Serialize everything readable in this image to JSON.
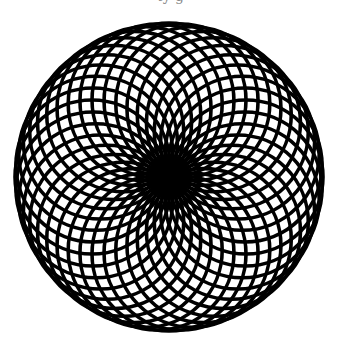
{
  "figure": {
    "caption_partial": "ty g",
    "pattern": "rotated-circles-through-center",
    "center": [
      169,
      177
    ],
    "circle_count": 40,
    "circle_radius": 77,
    "start_angle_deg": -90,
    "stroke_color": "#000000",
    "stroke_width": 3.6,
    "background": "#ffffff"
  }
}
